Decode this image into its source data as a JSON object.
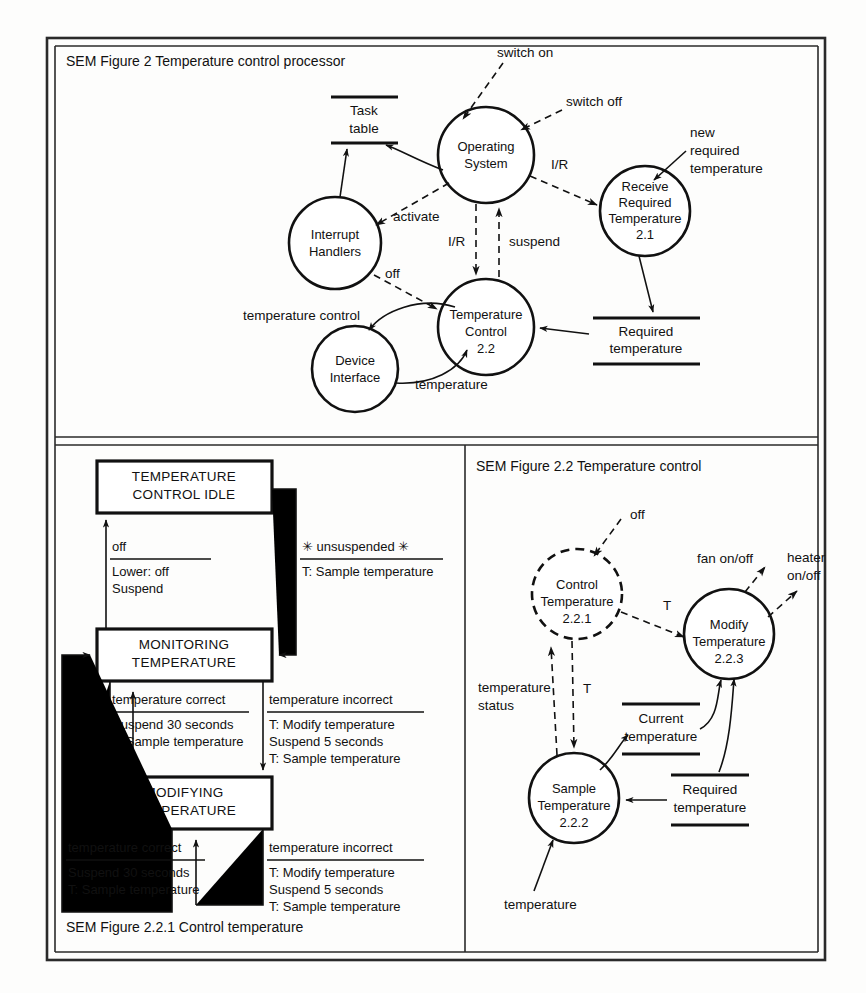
{
  "figures": {
    "fig2": {
      "caption": "SEM Figure 2  Temperature control processor",
      "nodes": {
        "os": "Operating System",
        "receive_l1": "Receive",
        "receive_l2": "Required",
        "receive_l3": "Temperature",
        "receive_id": "2.1",
        "interrupt_l1": "Interrupt",
        "interrupt_l2": "Handlers",
        "tempctl_l1": "Temperature",
        "tempctl_l2": "Control",
        "tempctl_id": "2.2",
        "device_l1": "Device",
        "device_l2": "Interface"
      },
      "stores": {
        "task_l1": "Task",
        "task_l2": "table",
        "required_l1": "Required",
        "required_l2": "temperature"
      },
      "flows": {
        "switch_on": "switch on",
        "switch_off": "switch off",
        "ir_right": "I/R",
        "new_req_l1": "new",
        "new_req_l2": "required",
        "new_req_l3": "temperature",
        "activate": "activate",
        "ir_down": "I/R",
        "suspend": "suspend",
        "off": "off",
        "temp_control": "temperature control",
        "temperature": "temperature"
      }
    },
    "fig221": {
      "caption": "SEM Figure 2.2.1  Control temperature",
      "states": {
        "idle_l1": "TEMPERATURE",
        "idle_l2": "CONTROL IDLE",
        "monitoring_l1": "MONITORING",
        "monitoring_l2": "TEMPERATURE",
        "modifying_l1": "MODIFYING",
        "modifying_l2": "TEMPERATURE"
      },
      "transitions": [
        {
          "id": "mon-to-idle",
          "condition": "off",
          "actions": [
            "Lower: off",
            "Suspend"
          ]
        },
        {
          "id": "idle-to-mon",
          "condition": "✳ unsuspended ✳",
          "actions": [
            "T: Sample temperature"
          ]
        },
        {
          "id": "mon-self",
          "condition": "temperature correct",
          "actions": [
            "Suspend 30 seconds",
            "T: Sample temperature"
          ]
        },
        {
          "id": "mon-to-mod",
          "condition": "temperature incorrect",
          "actions": [
            "T: Modify temperature",
            "Suspend 5 seconds",
            "T: Sample temperature"
          ]
        },
        {
          "id": "mod-to-mon",
          "condition": "temperature correct",
          "actions": [
            "Suspend 30 seconds",
            "T: Sample temperature"
          ]
        },
        {
          "id": "mod-self",
          "condition": "temperature incorrect",
          "actions": [
            "T: Modify temperature",
            "Suspend 5 seconds",
            "T: Sample temperature"
          ]
        }
      ]
    },
    "fig22": {
      "caption": "SEM Figure 2.2  Temperature control",
      "nodes": {
        "control_l1": "Control",
        "control_l2": "Temperature",
        "control_id": "2.2.1",
        "modify_l1": "Modify",
        "modify_l2": "Temperature",
        "modify_id": "2.2.3",
        "sample_l1": "Sample",
        "sample_l2": "Temperature",
        "sample_id": "2.2.2"
      },
      "stores": {
        "current_l1": "Current",
        "current_l2": "temperature",
        "required_l1": "Required",
        "required_l2": "temperature"
      },
      "flows": {
        "off": "off",
        "fan": "fan on/off",
        "heater_l1": "heater",
        "heater_l2": "on/off",
        "t_right": "T",
        "status_l1": "temperature",
        "status_l2": "status",
        "t_down": "T",
        "temperature": "temperature"
      }
    }
  }
}
